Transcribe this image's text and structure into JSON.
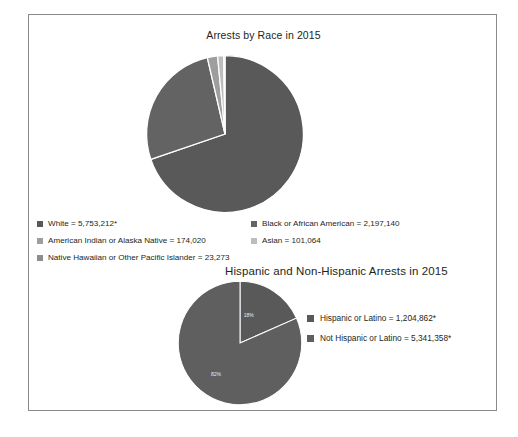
{
  "figure": {
    "border_color": "#8a8a8a",
    "background": "#ffffff"
  },
  "chart_data": [
    {
      "type": "pie",
      "title": "Arrests by Race in 2015",
      "categories": [
        "White",
        "Black or African American",
        "American Indian or Alaska Native",
        "Asian",
        "Native Hawaiian or Other Pacific Islander"
      ],
      "values": [
        5753212,
        2197140,
        174020,
        101064,
        23273
      ],
      "value_labels": [
        "5,753,212*",
        "2,197,140",
        "174,020",
        "101,064",
        "23,273"
      ],
      "legend_entries": [
        "White = 5,753,212*",
        "Black or African American = 2,197,140",
        "American Indian or Alaska Native = 174,020",
        "Asian = 101,064",
        "Native Hawaiian or Other Pacific Islander = 23,273"
      ],
      "colors": [
        "#595959",
        "#636363",
        "#9e9e9e",
        "#bdbdbd",
        "#8c8c8c"
      ],
      "legend_position": "bottom",
      "slice_labels_shown": false,
      "start_angle": 0,
      "direction": "clockwise"
    },
    {
      "type": "pie",
      "title": "Hispanic and Non-Hispanic Arrests in 2015",
      "categories": [
        "Hispanic or Latino",
        "Not Hispanic or Latino"
      ],
      "values": [
        1204862,
        5341358
      ],
      "value_labels": [
        "1,204,862*",
        "5,341,358*"
      ],
      "percent_labels": [
        "18%",
        "82%"
      ],
      "legend_entries": [
        "Hispanic or Latino = 1,204,862*",
        "Not Hispanic or Latino = 5,341,358*"
      ],
      "colors": [
        "#595959",
        "#5f5f5f"
      ],
      "legend_position": "right",
      "slice_labels_shown": true,
      "start_angle": 0,
      "direction": "clockwise"
    }
  ]
}
